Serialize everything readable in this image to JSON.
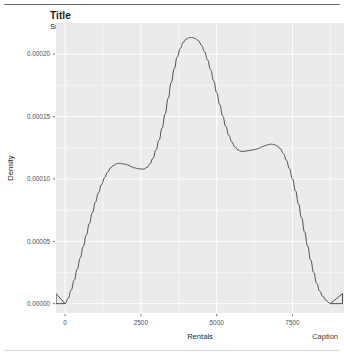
{
  "header": {
    "title": "Title",
    "subtitle": "Subtitle"
  },
  "footer": {
    "caption": "Caption"
  },
  "chart_data": {
    "type": "line",
    "title": "Title",
    "subtitle": "Subtitle",
    "caption": "Caption",
    "xlabel": "Rentals",
    "ylabel": "Density",
    "xlim": [
      -300,
      9200
    ],
    "ylim": [
      -7.5e-06,
      0.000225
    ],
    "xticks": [
      0,
      2500,
      5000,
      7500
    ],
    "xticklabels": [
      "0",
      "2500",
      "5000",
      "7500"
    ],
    "yticks": [
      0.0,
      5e-05,
      0.0001,
      0.00015,
      0.0002
    ],
    "yticklabels": [
      "0.00000",
      "0.00005",
      "0.00010",
      "0.00015",
      "0.00020"
    ],
    "grid": true,
    "grid_color": "#ffffff",
    "panel_color": "#ebebeb",
    "line_color": "#4d4d4d",
    "legend": null,
    "series": [
      {
        "name": "Density",
        "x": [
          0,
          100,
          200,
          300,
          400,
          500,
          600,
          700,
          800,
          900,
          1000,
          1100,
          1200,
          1300,
          1400,
          1500,
          1600,
          1700,
          1800,
          1900,
          2000,
          2100,
          2200,
          2300,
          2400,
          2500,
          2600,
          2700,
          2800,
          2900,
          3000,
          3100,
          3200,
          3300,
          3400,
          3500,
          3600,
          3700,
          3800,
          3900,
          4000,
          4100,
          4200,
          4300,
          4400,
          4500,
          4600,
          4700,
          4800,
          4900,
          5000,
          5100,
          5200,
          5300,
          5400,
          5500,
          5600,
          5700,
          5800,
          5900,
          6000,
          6100,
          6200,
          6300,
          6400,
          6500,
          6600,
          6700,
          6800,
          6900,
          7000,
          7100,
          7200,
          7300,
          7400,
          7500,
          7600,
          7700,
          7800,
          7900,
          8000,
          8100,
          8200,
          8300,
          8400,
          8500,
          8600,
          8700,
          8750
        ],
        "y": [
          0.0,
          4.2e-06,
          1.08e-05,
          1.88e-05,
          2.75e-05,
          3.67e-05,
          4.58e-05,
          5.5e-05,
          6.42e-05,
          7.29e-05,
          8.13e-05,
          8.88e-05,
          9.54e-05,
          0.0001008,
          0.0001054,
          0.0001088,
          0.0001108,
          0.0001121,
          0.0001125,
          0.0001121,
          0.0001117,
          0.0001108,
          0.0001096,
          0.0001088,
          0.0001083,
          0.0001079,
          0.0001079,
          0.0001092,
          0.0001121,
          0.0001167,
          0.0001233,
          0.0001312,
          0.0001408,
          0.0001521,
          0.0001646,
          0.0001771,
          0.0001883,
          0.0001979,
          0.0002046,
          0.0002096,
          0.0002121,
          0.0002133,
          0.0002133,
          0.0002125,
          0.0002108,
          0.0002071,
          0.0002021,
          0.0001954,
          0.0001875,
          0.0001787,
          0.0001692,
          0.0001596,
          0.0001504,
          0.0001421,
          0.000135,
          0.0001296,
          0.0001258,
          0.0001233,
          0.0001221,
          0.0001221,
          0.0001225,
          0.0001229,
          0.0001233,
          0.0001238,
          0.0001246,
          0.0001258,
          0.0001267,
          0.0001275,
          0.0001279,
          0.0001275,
          0.0001263,
          0.0001242,
          0.0001204,
          0.000115,
          0.0001083,
          0.0001,
          9.04e-05,
          8e-05,
          6.88e-05,
          5.75e-05,
          4.62e-05,
          3.5e-05,
          2.5e-05,
          1.63e-05,
          1e-05,
          5.8e-06,
          2.9e-06,
          8e-07,
          0.0
        ]
      }
    ],
    "baseline": {
      "x": [
        -300,
        9150
      ],
      "y": 0.0
    }
  }
}
